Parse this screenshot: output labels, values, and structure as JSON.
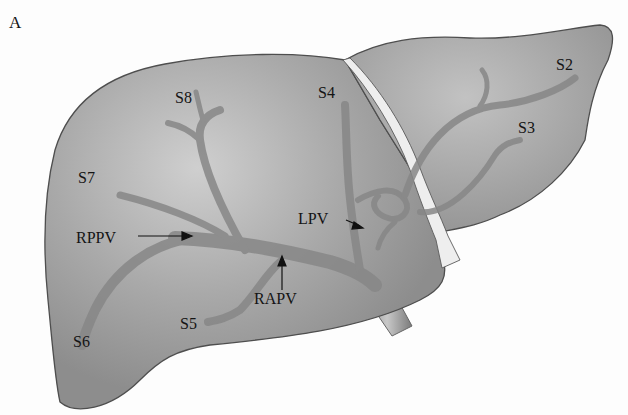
{
  "figure": {
    "panel_label": "A",
    "colors": {
      "liver_fill": "#9b9b9b",
      "liver_highlight": "#c4c4c4",
      "liver_outline": "#555555",
      "vessel": "#8a8a8a",
      "ligament": "#eeeeee",
      "ivc": "#a8a8a8"
    }
  },
  "labels": {
    "s2": "S2",
    "s3": "S3",
    "s4": "S4",
    "s5": "S5",
    "s6": "S6",
    "s7": "S7",
    "s8": "S8",
    "rppv": "RPPV",
    "rapv": "RAPV",
    "lpv": "LPV"
  }
}
